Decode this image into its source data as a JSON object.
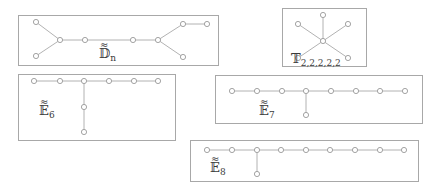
{
  "diagrams": [
    {
      "id": "D_n",
      "label": {
        "main": "𝔻",
        "sub": "n",
        "tilde": "≈"
      },
      "frame": {
        "x": 18,
        "y": 15,
        "w": 200,
        "h": 50
      },
      "nodes": [
        [
          36,
          22
        ],
        [
          36,
          56
        ],
        [
          60,
          40
        ],
        [
          85,
          40
        ],
        [
          133,
          40
        ],
        [
          158,
          40
        ],
        [
          183,
          24
        ],
        [
          207,
          24
        ],
        [
          183,
          57
        ]
      ],
      "edges": [
        [
          0,
          2
        ],
        [
          1,
          2
        ],
        [
          2,
          3
        ],
        [
          3,
          4
        ],
        [
          4,
          5
        ],
        [
          5,
          6
        ],
        [
          6,
          7
        ],
        [
          5,
          8
        ]
      ],
      "label_pos": [
        99,
        58
      ]
    },
    {
      "id": "T_2,2,2,2,2",
      "label": {
        "main": "𝕋",
        "sub": "2,2,2,2,2",
        "tilde": ""
      },
      "frame": {
        "x": 282,
        "y": 8,
        "w": 84,
        "h": 58
      },
      "nodes": [
        [
          323,
          41
        ],
        [
          323,
          15
        ],
        [
          298,
          24
        ],
        [
          348,
          24
        ],
        [
          298,
          58
        ],
        [
          348,
          58
        ]
      ],
      "edges": [
        [
          0,
          1
        ],
        [
          0,
          2
        ],
        [
          0,
          3
        ],
        [
          0,
          4
        ],
        [
          0,
          5
        ]
      ],
      "label_pos": [
        291,
        63
      ]
    },
    {
      "id": "E_6",
      "label": {
        "main": "𝔼",
        "sub": "6",
        "tilde": "≈"
      },
      "frame": {
        "x": 18,
        "y": 74,
        "w": 157,
        "h": 66
      },
      "nodes": [
        [
          34,
          81
        ],
        [
          60,
          81
        ],
        [
          84,
          81
        ],
        [
          109,
          81
        ],
        [
          134,
          81
        ],
        [
          158,
          81
        ],
        [
          84,
          107
        ],
        [
          84,
          132
        ]
      ],
      "edges": [
        [
          0,
          1
        ],
        [
          1,
          2
        ],
        [
          2,
          3
        ],
        [
          3,
          4
        ],
        [
          4,
          5
        ],
        [
          2,
          6
        ],
        [
          6,
          7
        ]
      ],
      "label_pos": [
        39,
        115
      ]
    },
    {
      "id": "E_7",
      "label": {
        "main": "𝔼",
        "sub": "7",
        "tilde": "≈"
      },
      "frame": {
        "x": 215,
        "y": 75,
        "w": 207,
        "h": 48
      },
      "nodes": [
        [
          232,
          91
        ],
        [
          257,
          91
        ],
        [
          282,
          91
        ],
        [
          306,
          91
        ],
        [
          331,
          91
        ],
        [
          356,
          91
        ],
        [
          380,
          91
        ],
        [
          405,
          91
        ],
        [
          306,
          115
        ]
      ],
      "edges": [
        [
          0,
          1
        ],
        [
          1,
          2
        ],
        [
          2,
          3
        ],
        [
          3,
          4
        ],
        [
          4,
          5
        ],
        [
          5,
          6
        ],
        [
          6,
          7
        ],
        [
          3,
          8
        ]
      ],
      "label_pos": [
        259,
        115
      ]
    },
    {
      "id": "E_8",
      "label": {
        "main": "𝔼",
        "sub": "8",
        "tilde": "≈"
      },
      "frame": {
        "x": 190,
        "y": 140,
        "w": 228,
        "h": 41
      },
      "nodes": [
        [
          207,
          150
        ],
        [
          232,
          150
        ],
        [
          257,
          150
        ],
        [
          281,
          150
        ],
        [
          306,
          150
        ],
        [
          330,
          150
        ],
        [
          355,
          150
        ],
        [
          380,
          150
        ],
        [
          404,
          150
        ],
        [
          257,
          174
        ]
      ],
      "edges": [
        [
          0,
          1
        ],
        [
          1,
          2
        ],
        [
          2,
          3
        ],
        [
          3,
          4
        ],
        [
          4,
          5
        ],
        [
          5,
          6
        ],
        [
          6,
          7
        ],
        [
          7,
          8
        ],
        [
          2,
          9
        ]
      ],
      "label_pos": [
        210,
        172
      ]
    }
  ]
}
